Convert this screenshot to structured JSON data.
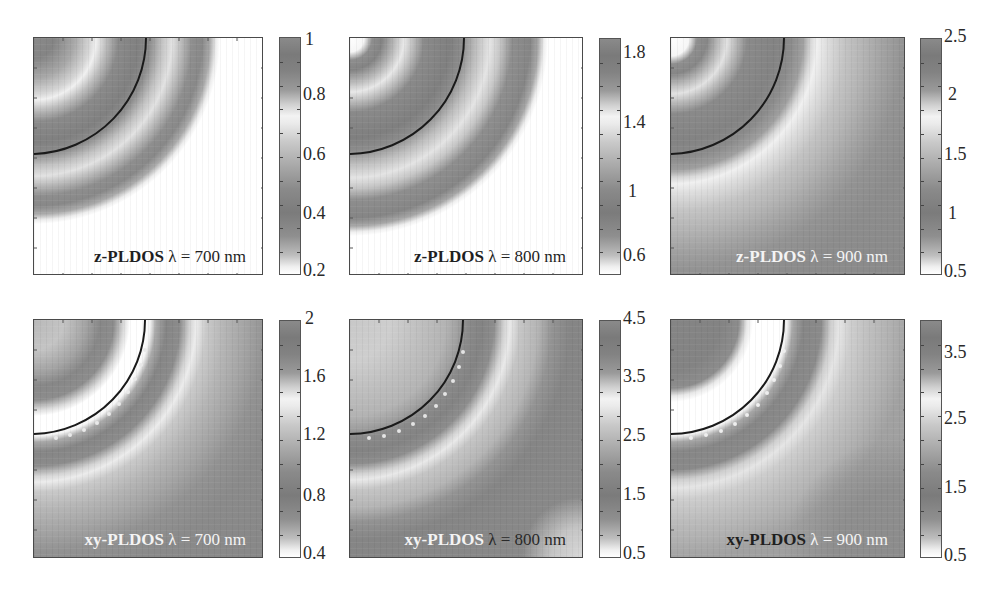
{
  "figure": {
    "colors": {
      "background": "#ffffff",
      "arc": "#1a1a1a",
      "frame": "#4a4a4a"
    }
  },
  "chart_data": [
    {
      "type": "heatmap",
      "title": "z-PLDOS λ = 700 nm",
      "label_bold": "z-PLDOS",
      "label_rest": " λ = 700 nm",
      "colorbar": {
        "ticks": [
          "1",
          "0.8",
          "0.6",
          "0.4",
          "0.2"
        ],
        "range": [
          0.2,
          1.0
        ]
      },
      "features": "concentric rings near the top-left corner inside and just outside the circular boundary; white (minimum) background beyond radius ~0.8 of panel",
      "grid": false
    },
    {
      "type": "heatmap",
      "title": "z-PLDOS λ = 800 nm",
      "label_bold": "z-PLDOS",
      "label_rest": " λ = 800 nm",
      "colorbar": {
        "ticks": [
          "1.8",
          "1.4",
          "1",
          "0.6"
        ],
        "range": [
          0.5,
          1.9
        ]
      },
      "features": "concentric rings extending slightly further than 700 nm; white background in the lower-right region",
      "grid": false
    },
    {
      "type": "heatmap",
      "title": "z-PLDOS λ = 900 nm",
      "label_bold": "z-PLDOS",
      "label_rest": " λ = 900 nm",
      "colorbar": {
        "ticks": [
          "2.5",
          "2",
          "1.5",
          "1",
          "0.5"
        ],
        "range": [
          0.5,
          2.5
        ]
      },
      "features": "rings near corner; light ring just outside boundary; medium-dark gray fill across the rest of the panel",
      "grid": false
    },
    {
      "type": "heatmap",
      "title": "xy-PLDOS λ = 700 nm",
      "label_bold": "xy-PLDOS",
      "label_rest": " λ = 700 nm",
      "colorbar": {
        "ticks": [
          "2",
          "1.6",
          "1.2",
          "0.8",
          "0.4"
        ],
        "range": [
          0.4,
          2.0
        ]
      },
      "features": "bright white band just inside the circular boundary, dotted ring just outside, broad diffuse halo toward lower-right",
      "grid": false
    },
    {
      "type": "heatmap",
      "title": "xy-PLDOS λ = 800 nm",
      "label_bold": "xy-PLDOS",
      "label_rest": " λ = 800 nm",
      "colorbar": {
        "ticks": [
          "4.5",
          "3.5",
          "2.5",
          "1.5",
          "0.5"
        ],
        "range": [
          0.5,
          4.5
        ]
      },
      "features": "light interior inside boundary, dark dotted ring outside, lighter ring further out, light patches at the bottom-right",
      "grid": false
    },
    {
      "type": "heatmap",
      "title": "xy-PLDOS λ = 900 nm",
      "label_bold": "xy-PLDOS",
      "label_rest": " λ = 900 nm",
      "colorbar": {
        "ticks": [
          "3.5",
          "2.5",
          "1.5",
          "0.5"
        ],
        "range": [
          0.5,
          4.0
        ]
      },
      "features": "dark interior core with a white band inside the boundary, dark dotted ring outside, light broad ring, darker lower-right region",
      "grid": false
    }
  ]
}
